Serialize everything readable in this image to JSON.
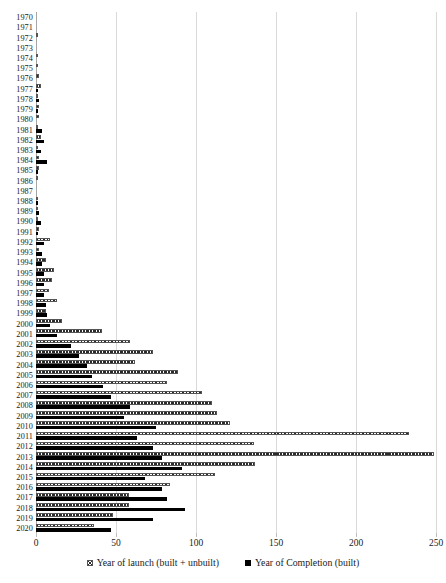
{
  "chart_data": {
    "type": "bar",
    "orientation": "horizontal",
    "title": "",
    "xlabel": "",
    "ylabel": "",
    "xlim": [
      0,
      250
    ],
    "xticks": [
      0,
      50,
      100,
      150,
      200,
      250
    ],
    "xticklabels": [
      "0",
      "50",
      "100",
      "150",
      "200",
      "250"
    ],
    "grid": true,
    "grid_axis": "x",
    "legend_position": "bottom",
    "categories": [
      "1970",
      "1971",
      "1972",
      "1973",
      "1974",
      "1975",
      "1976",
      "1977",
      "1978",
      "1979",
      "1980",
      "1981",
      "1982",
      "1983",
      "1984",
      "1985",
      "1986",
      "1987",
      "1988",
      "1989",
      "1990",
      "1991",
      "1992",
      "1993",
      "1994",
      "1995",
      "1996",
      "1997",
      "1998",
      "1999",
      "2000",
      "2001",
      "2002",
      "2003",
      "2004",
      "2005",
      "2006",
      "2007",
      "2008",
      "2009",
      "2010",
      "2011",
      "2012",
      "2013",
      "2014",
      "2015",
      "2016",
      "2017",
      "2018",
      "2019",
      "2020"
    ],
    "series": [
      {
        "name": "Year of launch (built + unbuilt)",
        "key": "launch",
        "pattern": "hatched",
        "color": "#2b2b2b",
        "values": [
          0,
          0,
          1,
          0,
          1,
          1,
          2,
          3,
          1,
          2,
          2,
          1,
          3,
          1,
          2,
          2,
          1,
          0,
          1,
          1,
          1,
          2,
          9,
          2,
          6,
          11,
          10,
          8,
          13,
          6,
          16,
          41,
          59,
          73,
          62,
          89,
          82,
          104,
          110,
          113,
          121,
          233,
          136,
          249,
          137,
          112,
          84,
          58,
          58,
          48,
          36
        ]
      },
      {
        "name": "Year of Completion (built)",
        "key": "completion",
        "pattern": "solid",
        "color": "#000000",
        "values": [
          0,
          0,
          0,
          0,
          0,
          0,
          0,
          1,
          2,
          1,
          0,
          4,
          5,
          3,
          7,
          1,
          0,
          0,
          1,
          2,
          3,
          1,
          5,
          4,
          4,
          5,
          5,
          5,
          6,
          7,
          9,
          13,
          22,
          27,
          32,
          35,
          42,
          47,
          59,
          55,
          75,
          63,
          73,
          79,
          91,
          68,
          79,
          82,
          93,
          73,
          47
        ]
      }
    ]
  },
  "legend": {
    "items": [
      {
        "label": "Year of launch (built + unbuilt)",
        "swatch": "hatched-square-icon"
      },
      {
        "label": "Year of Completion (built)",
        "swatch": "black-square-icon"
      }
    ]
  },
  "axis": {
    "x_tick_labels": [
      "0",
      "50",
      "100",
      "150",
      "200",
      "250"
    ]
  }
}
